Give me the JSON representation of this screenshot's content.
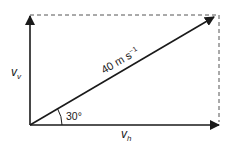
{
  "diagram": {
    "type": "vector-resolution",
    "resultant": {
      "label": "40 m s",
      "unit_exponent": "−1",
      "magnitude": 40
    },
    "angle_label": "30°",
    "vertical_component": {
      "symbol": "v",
      "subscript": "v"
    },
    "horizontal_component": {
      "symbol": "v",
      "subscript": "h"
    },
    "colors": {
      "stroke": "#1a1a1a",
      "dashed": "#555555"
    }
  }
}
